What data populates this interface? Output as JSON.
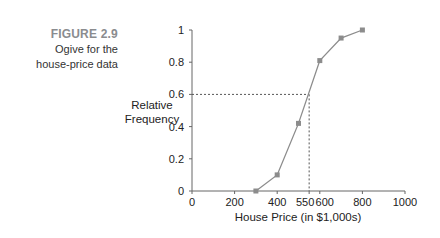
{
  "figure": {
    "number": "FIGURE 2.9",
    "caption_line1": "Ogive for the",
    "caption_line2": "house-price data"
  },
  "chart_data": {
    "type": "line",
    "title": "Ogive for the house-price data",
    "xlabel": "House Price (in $1,000s)",
    "ylabel": "Relative Frequency",
    "ylabel_line1": "Relative",
    "ylabel_line2": "Frequency",
    "x": [
      300,
      400,
      500,
      600,
      700,
      800
    ],
    "values": [
      0.0,
      0.1,
      0.42,
      0.81,
      0.95,
      1.0
    ],
    "xlim": [
      0,
      1000
    ],
    "ylim": [
      0,
      1
    ],
    "x_ticks": [
      "0",
      "200",
      "400",
      "550",
      "600",
      "800",
      "1000"
    ],
    "y_ticks": [
      "0",
      "0.2",
      "0.4",
      "0.6",
      "0.8",
      "1"
    ],
    "annotation": {
      "x": 550,
      "y": 0.6,
      "style": "dashed reference lines"
    },
    "grid": false,
    "marker": "square",
    "line_color": "#8c8c8c"
  }
}
